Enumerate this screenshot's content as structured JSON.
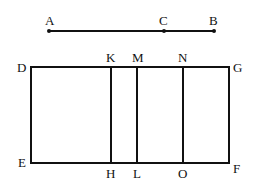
{
  "diagram": {
    "segment": {
      "points": [
        {
          "label": "A",
          "x": 49,
          "y": 31
        },
        {
          "label": "C",
          "x": 164,
          "y": 31
        },
        {
          "label": "B",
          "x": 214,
          "y": 31
        }
      ]
    },
    "rectangle": {
      "corners": {
        "D": {
          "label": "D",
          "x": 31,
          "y": 67
        },
        "G": {
          "label": "G",
          "x": 229,
          "y": 67
        },
        "E": {
          "label": "E",
          "x": 31,
          "y": 163
        },
        "F": {
          "label": "F",
          "x": 229,
          "y": 163
        }
      },
      "dividers": [
        {
          "top": "K",
          "bottom": "H",
          "x": 111
        },
        {
          "top": "M",
          "bottom": "L",
          "x": 137
        },
        {
          "top": "N",
          "bottom": "O",
          "x": 183
        }
      ]
    },
    "colors": {
      "stroke": "#111111",
      "background": "#ffffff"
    }
  }
}
